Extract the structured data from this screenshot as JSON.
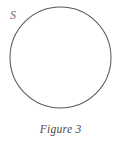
{
  "figure": {
    "caption_label": "Figure",
    "caption_number": "3",
    "caption_full": "Figure 3"
  },
  "diagram": {
    "type": "venn-single-set",
    "shapes": [
      {
        "name": "set-circle",
        "shape": "circle",
        "label": "S",
        "filled": false,
        "stroke_color": "#595959",
        "fill_color": "#ffffff"
      }
    ],
    "labels": {
      "set_s": "S"
    }
  },
  "colors": {
    "background": "#ffffff",
    "stroke": "#595959",
    "label_text": "#6d6d6d",
    "caption_text": "#4a4a4a"
  }
}
